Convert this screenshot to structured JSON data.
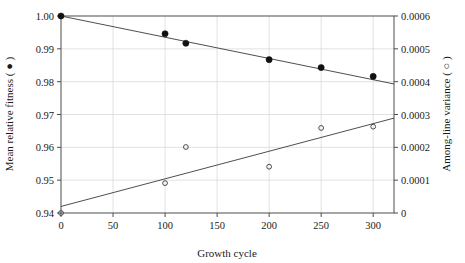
{
  "chart_data": {
    "type": "scatter",
    "title": "",
    "subtitle": "",
    "xlabel": "Growth cycle",
    "ylabel": "Mean relative fitness ( ● )",
    "y2label": "Among-line variance ( ○ )",
    "xlim": [
      0,
      320
    ],
    "ylim": [
      0.94,
      1.0
    ],
    "y2lim": [
      0,
      0.0006
    ],
    "grid": true,
    "legend_position": "none",
    "xticks": [
      0,
      50,
      100,
      150,
      200,
      250,
      300
    ],
    "xtick_labels": [
      "0",
      "50",
      "100",
      "150",
      "200",
      "250",
      "300"
    ],
    "yticks": [
      0.94,
      0.95,
      0.96,
      0.97,
      0.98,
      0.99,
      1.0
    ],
    "ytick_labels": [
      "0.94",
      "0.95",
      "0.96",
      "0.97",
      "0.98",
      "0.99",
      "1.00"
    ],
    "y2ticks": [
      0,
      0.0001,
      0.0002,
      0.0003,
      0.0004,
      0.0005,
      0.0006
    ],
    "y2tick_labels": [
      "0",
      "0.0001",
      "0.0002",
      "0.0003",
      "0.0004",
      "0.0005",
      "0.0006"
    ],
    "series": [
      {
        "name": "Mean relative fitness",
        "marker": "filled-circle",
        "axis": "left",
        "x": [
          0,
          100,
          120,
          200,
          250,
          300
        ],
        "values": [
          1.0,
          0.9946,
          0.9917,
          0.9867,
          0.9843,
          0.9816
        ]
      },
      {
        "name": "Among-line variance",
        "marker": "open-circle",
        "axis": "right",
        "x": [
          0,
          100,
          120,
          200,
          250,
          300
        ],
        "values": [
          0.0,
          9.1e-05,
          0.000201,
          0.000141,
          0.000259,
          0.000263
        ]
      }
    ],
    "trendlines": [
      {
        "name": "fitness-trend",
        "axis": "left",
        "x": [
          0,
          320
        ],
        "values": [
          1.0,
          0.9793
        ]
      },
      {
        "name": "variance-trend",
        "axis": "right",
        "x": [
          0,
          320
        ],
        "values": [
          2e-05,
          0.000289
        ]
      }
    ]
  }
}
